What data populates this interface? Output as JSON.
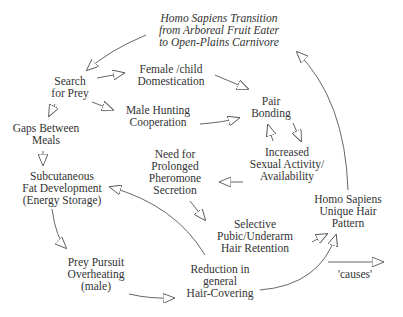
{
  "diagram": {
    "type": "causal-loop",
    "nodes": [
      {
        "id": "transition",
        "lines": [
          "Homo Sapiens Transition",
          "from Arboreal Fruit Eater",
          "to Open-Plains Carnivore"
        ],
        "italic": true
      },
      {
        "id": "search",
        "lines": [
          "Search",
          "for Prey"
        ]
      },
      {
        "id": "female",
        "lines": [
          "Female /child",
          "Domestication"
        ]
      },
      {
        "id": "male",
        "lines": [
          "Male Hunting",
          "Cooperation"
        ]
      },
      {
        "id": "pair",
        "lines": [
          "Pair",
          "Bonding"
        ]
      },
      {
        "id": "gaps",
        "lines": [
          "Gaps Between",
          "Meals"
        ]
      },
      {
        "id": "sexual",
        "lines": [
          "Increased",
          "Sexual Activity/",
          "Availability"
        ]
      },
      {
        "id": "pheromone",
        "lines": [
          "Need for",
          "Prolonged",
          "Pheromone",
          "Secretion"
        ]
      },
      {
        "id": "fat",
        "lines": [
          "Subcutaneous",
          "Fat Development",
          "(Energy Storage)"
        ]
      },
      {
        "id": "unique",
        "lines": [
          "Homo Sapiens",
          "Unique Hair",
          "Pattern"
        ]
      },
      {
        "id": "selective",
        "lines": [
          "Selective",
          "Pubic/Underarm",
          "Hair Retention"
        ]
      },
      {
        "id": "overheating",
        "lines": [
          "Prey Pursuit",
          "Overheating",
          "(male)"
        ]
      },
      {
        "id": "reduction",
        "lines": [
          "Reduction in",
          "general",
          "Hair-Covering"
        ]
      }
    ],
    "edges": [
      {
        "from": "transition",
        "to": "search"
      },
      {
        "from": "search",
        "to": "female"
      },
      {
        "from": "search",
        "to": "male"
      },
      {
        "from": "search",
        "to": "gaps"
      },
      {
        "from": "female",
        "to": "pair"
      },
      {
        "from": "male",
        "to": "pair"
      },
      {
        "from": "pair",
        "to": "sexual"
      },
      {
        "from": "sexual",
        "to": "pair"
      },
      {
        "from": "sexual",
        "to": "pheromone"
      },
      {
        "from": "gaps",
        "to": "fat"
      },
      {
        "from": "pheromone",
        "to": "selective"
      },
      {
        "from": "reduction",
        "to": "fat"
      },
      {
        "from": "fat",
        "to": "overheating"
      },
      {
        "from": "overheating",
        "to": "reduction"
      },
      {
        "from": "reduction",
        "to": "unique"
      },
      {
        "from": "selective",
        "to": "unique"
      },
      {
        "from": "unique",
        "to": "transition"
      }
    ],
    "legend": {
      "label": "'causes'"
    }
  },
  "colors": {
    "line": "#555555",
    "text": "#333333",
    "background": "#ffffff"
  }
}
